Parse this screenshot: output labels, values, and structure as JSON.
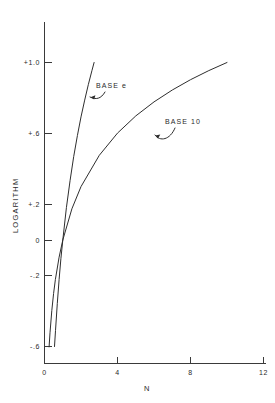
{
  "figure": {
    "background_color": "#ffffff",
    "ink_color": "#2e2e2e"
  },
  "chart_data": {
    "type": "line",
    "title": "",
    "subtitle": "",
    "xlabel": "N",
    "ylabel": "LOGARITHM",
    "xlim": [
      0,
      12
    ],
    "ylim": [
      -0.6,
      1.0
    ],
    "grid": false,
    "legend_position": "inline-annotation",
    "x_ticks": [
      0,
      4,
      8,
      12
    ],
    "x_tick_labels": [
      "0",
      "4",
      "8",
      "12"
    ],
    "y_ticks": [
      1.0,
      0.6,
      0.2,
      0.0,
      -0.2,
      -0.6
    ],
    "y_tick_labels": [
      "+1.0",
      "+.6",
      "+.2",
      "0",
      "-.2",
      "-.6"
    ],
    "annotations": [
      {
        "text": "BASE e",
        "points_to": "base-e-curve"
      },
      {
        "text": "BASE 10",
        "points_to": "base-10-curve"
      }
    ],
    "series": [
      {
        "name": "BASE e",
        "formula": "log base e of N",
        "x": [
          0.55,
          0.6,
          0.7,
          0.8,
          0.9,
          1.0,
          1.2,
          1.4,
          1.6,
          1.8,
          2.0,
          2.2,
          2.4,
          2.6,
          2.718
        ],
        "values": [
          -0.598,
          -0.511,
          -0.357,
          -0.223,
          -0.105,
          0.0,
          0.182,
          0.336,
          0.47,
          0.588,
          0.693,
          0.788,
          0.875,
          0.956,
          1.0
        ]
      },
      {
        "name": "BASE 10",
        "formula": "log base 10 of N",
        "x": [
          0.25,
          0.3,
          0.4,
          0.5,
          0.6,
          0.8,
          1.0,
          1.5,
          2.0,
          3.0,
          4.0,
          5.0,
          6.0,
          7.0,
          8.0,
          9.0,
          10.0
        ],
        "values": [
          -0.602,
          -0.523,
          -0.398,
          -0.301,
          -0.222,
          -0.097,
          0.0,
          0.176,
          0.301,
          0.477,
          0.602,
          0.699,
          0.778,
          0.845,
          0.903,
          0.954,
          1.0
        ]
      }
    ]
  }
}
